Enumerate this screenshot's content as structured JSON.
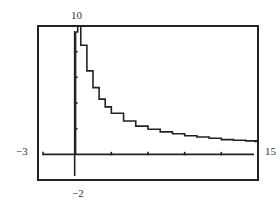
{
  "chart_data": {
    "type": "line",
    "title": "",
    "xlabel": "",
    "ylabel": "",
    "xlim": [
      -3,
      15
    ],
    "ylim": [
      -2,
      10
    ],
    "x_ticks": [
      3,
      6,
      9,
      12,
      15
    ],
    "y_ticks": [
      -2,
      2,
      4,
      6,
      8
    ],
    "grid": false,
    "legend": null,
    "window_labels": {
      "ymax": "10",
      "ymin": "−2",
      "xmin": "−3",
      "xmax": "15"
    },
    "series": [
      {
        "name": "f(x)",
        "style": "step",
        "x": [
          0.05,
          0.25,
          0.5,
          1,
          1.5,
          2,
          2.5,
          3,
          4,
          5,
          6,
          7,
          8,
          9,
          10,
          11,
          12,
          13,
          14,
          15
        ],
        "values": [
          10,
          10,
          8.5,
          6.5,
          5.2,
          4.3,
          3.7,
          3.2,
          2.6,
          2.2,
          1.95,
          1.75,
          1.6,
          1.45,
          1.35,
          1.25,
          1.15,
          1.1,
          1.05,
          1.0
        ]
      }
    ],
    "frame": {
      "left": 38,
      "top": 26,
      "right": 258,
      "bottom": 180
    }
  }
}
